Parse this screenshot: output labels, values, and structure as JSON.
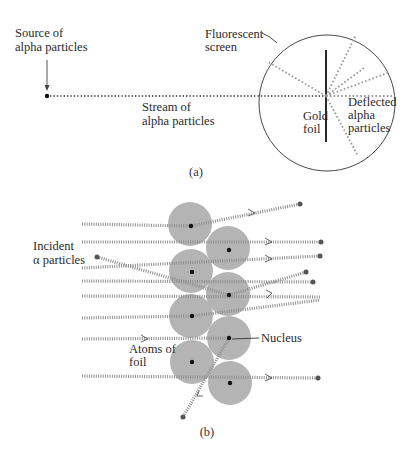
{
  "figure_a": {
    "caption": "(a)",
    "labels": {
      "source_line1": "Source of",
      "source_line2": "alpha particles",
      "screen_line1": "Fluorescent",
      "screen_line2": "screen",
      "stream_line1": "Stream of",
      "stream_line2": "alpha particles",
      "foil_line1": "Gold",
      "foil_line2": "foil",
      "deflected_line1": "Deflected",
      "deflected_line2": "alpha",
      "deflected_line3": "particles"
    }
  },
  "figure_b": {
    "caption": "(b)",
    "labels": {
      "incident_line1": "Incident",
      "incident_line2": "α particles",
      "atoms_line1": "Atoms of",
      "atoms_line2": "foil",
      "nucleus": "Nucleus"
    }
  },
  "colors": {
    "atom_fill": "#b3b3b3",
    "nucleus": "#111111",
    "track": "#9a9a9a",
    "ink": "#333333"
  }
}
